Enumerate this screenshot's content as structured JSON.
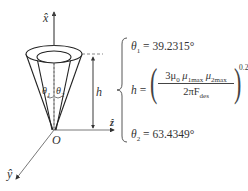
{
  "diagram": {
    "type": "cone-geometry-schematic",
    "axes": {
      "x": {
        "label": "x̂",
        "direction": "up"
      },
      "z": {
        "label": "ẑ",
        "direction": "right"
      },
      "y": {
        "label": "ŷ",
        "direction": "down-left"
      }
    },
    "origin_label": "O",
    "height_label": "h",
    "angle_labels": {
      "theta1": "θ",
      "theta1_sub": "1",
      "theta2": "θ",
      "theta2_sub": "2"
    },
    "stroke_color": "#333333",
    "background_color": "#ffffff"
  },
  "equations": {
    "theta1": {
      "symbol": "θ",
      "sub": "1",
      "rhs": "= 39.2315°"
    },
    "h": {
      "symbol": "h",
      "eq": "=",
      "numerator_coeff": "3μ",
      "numerator_mu0_sub": "0",
      "numerator_mu1": "μ",
      "numerator_mu1_sub": "1max",
      "numerator_mu2": "μ",
      "numerator_mu2_sub": "2max",
      "denominator": "2πF",
      "denominator_sub": "des",
      "exponent": "0.25"
    },
    "theta2": {
      "symbol": "θ",
      "sub": "2",
      "rhs": "= 63.4349°"
    }
  }
}
